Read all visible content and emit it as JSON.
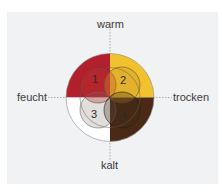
{
  "diagram": {
    "type": "four-humors-quadrant-diagram",
    "axes": {
      "top": "warm",
      "bottom": "kalt",
      "left": "feucht",
      "right": "trocken"
    },
    "quadrants": [
      {
        "id": "1",
        "label": "1",
        "position": "top-left",
        "color": "#b21f2d"
      },
      {
        "id": "2",
        "label": "2",
        "position": "top-right",
        "color": "#f2c22e"
      },
      {
        "id": "3",
        "label": "3",
        "position": "bottom-left",
        "color": "#ffffff"
      },
      {
        "id": "4",
        "label": "4",
        "position": "bottom-right",
        "color": "#4a2a16"
      }
    ],
    "colors": {
      "background": "#f1f2f4",
      "axis_line": "#9a9a9a",
      "outline": "#8a8a8a"
    }
  }
}
